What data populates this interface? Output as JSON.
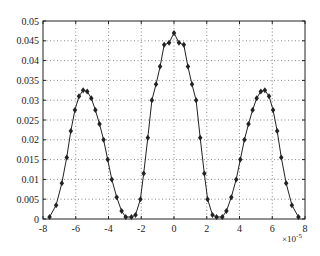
{
  "chart_data": {
    "type": "line",
    "title": "",
    "xlabel": "",
    "ylabel": "",
    "x_multiplier_label": "×10",
    "x_multiplier_exp": "-5",
    "xlim": [
      -8,
      8
    ],
    "ylim": [
      0,
      0.05
    ],
    "grid": true,
    "legend": null,
    "xticks": [
      -8,
      -6,
      -4,
      -2,
      0,
      2,
      4,
      6,
      8
    ],
    "xtick_labels": [
      "-8",
      "-6",
      "-4",
      "-2",
      "0",
      "2",
      "4",
      "6",
      "8"
    ],
    "yticks": [
      0,
      0.005,
      0.01,
      0.015,
      0.02,
      0.025,
      0.03,
      0.035,
      0.04,
      0.045,
      0.05
    ],
    "ytick_labels": [
      "0",
      "0.005",
      "0.01",
      "0.015",
      "0.02",
      "0.025",
      "0.03",
      "0.035",
      "0.04",
      "0.045",
      "0.05"
    ],
    "series": [
      {
        "name": "series1",
        "marker": "diamond",
        "color": "#222222",
        "x": [
          -7.6,
          -7.2,
          -6.85,
          -6.55,
          -6.3,
          -6.05,
          -5.8,
          -5.55,
          -5.3,
          -5.05,
          -4.8,
          -4.55,
          -4.3,
          -4.05,
          -3.8,
          -3.5,
          -3.2,
          -2.95,
          -2.6,
          -2.35,
          -2.05,
          -1.85,
          -1.6,
          -1.35,
          -1.1,
          -0.85,
          -0.6,
          -0.3,
          0,
          0.3,
          0.6,
          0.85,
          1.1,
          1.35,
          1.6,
          1.85,
          2.05,
          2.35,
          2.6,
          2.95,
          3.2,
          3.5,
          3.8,
          4.05,
          4.3,
          4.55,
          4.8,
          5.05,
          5.3,
          5.55,
          5.8,
          6.05,
          6.3,
          6.55,
          6.85,
          7.2,
          7.6
        ],
        "y": [
          0.0005,
          0.0035,
          0.009,
          0.0155,
          0.0222,
          0.0275,
          0.031,
          0.0325,
          0.0322,
          0.0305,
          0.0275,
          0.024,
          0.02,
          0.015,
          0.01,
          0.0055,
          0.002,
          0.0005,
          0.0005,
          0.001,
          0.005,
          0.0115,
          0.0205,
          0.03,
          0.034,
          0.0385,
          0.044,
          0.0445,
          0.047,
          0.0445,
          0.044,
          0.0385,
          0.034,
          0.03,
          0.0205,
          0.0115,
          0.005,
          0.001,
          0.0005,
          0.0005,
          0.002,
          0.0055,
          0.01,
          0.015,
          0.02,
          0.024,
          0.0275,
          0.0305,
          0.0322,
          0.0325,
          0.031,
          0.0275,
          0.0222,
          0.0155,
          0.009,
          0.0035,
          0.0005
        ]
      }
    ]
  }
}
